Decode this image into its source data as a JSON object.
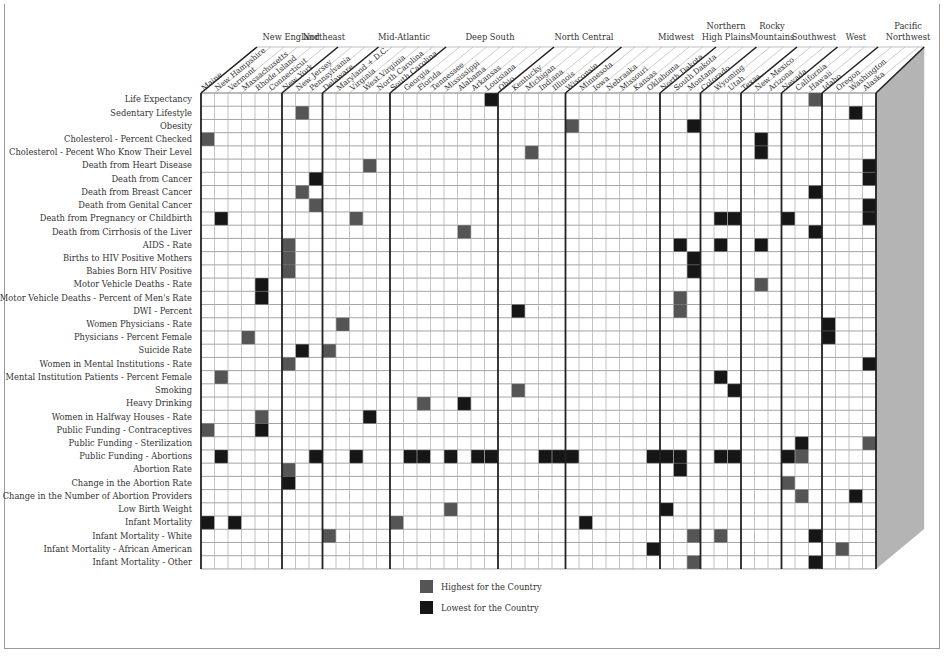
{
  "chart_data": {
    "type": "heatmap",
    "title": "",
    "legend": [
      {
        "key": "H",
        "label": "Highest for the Country",
        "color": "#555555"
      },
      {
        "key": "L",
        "label": "Lowest for the Country",
        "color": "#161616"
      }
    ],
    "regions": [
      {
        "name": "New England",
        "lines": [
          "New England"
        ],
        "states": [
          "Maine",
          "New Hampshire",
          "Vermont",
          "Massachusetts",
          "Rhode Island",
          "Connecticut"
        ]
      },
      {
        "name": "Northeast",
        "lines": [
          "Northeast"
        ],
        "states": [
          "New York",
          "New Jersey",
          "Pennsylvania"
        ]
      },
      {
        "name": "Mid-Atlantic",
        "lines": [
          "Mid-Atlantic"
        ],
        "states": [
          "Delaware",
          "Maryland + D.C.",
          "Virginia",
          "West Virginia",
          "North Carolina"
        ]
      },
      {
        "name": "Deep South",
        "lines": [
          "Deep South"
        ],
        "states": [
          "South Carolina",
          "Georgia",
          "Florida",
          "Tennessee",
          "Mississippi",
          "Alabama",
          "Arkansas",
          "Louisiana"
        ]
      },
      {
        "name": "North Central",
        "lines": [
          "North Central"
        ],
        "states": [
          "Ohio",
          "Kentucky",
          "Michigan",
          "Indiana",
          "Illinois"
        ]
      },
      {
        "name": "Midwest",
        "lines": [
          "Midwest"
        ],
        "states": [
          "Wisconsin",
          "Minnesota",
          "Iowa",
          "Nebraska",
          "Missouri",
          "Kansas",
          "Oklahoma"
        ]
      },
      {
        "name": "Northern High Plains",
        "lines": [
          "Northern",
          "High Plains"
        ],
        "states": [
          "North Dakota",
          "South Dakota",
          "Montana"
        ]
      },
      {
        "name": "Rocky Mountains",
        "lines": [
          "Rocky",
          "Mountains"
        ],
        "states": [
          "Colorado",
          "Wyoming",
          "Utah"
        ]
      },
      {
        "name": "Southwest",
        "lines": [
          "Southwest"
        ],
        "states": [
          "Texas",
          "New Mexico",
          "Arizona"
        ]
      },
      {
        "name": "West",
        "lines": [
          "West"
        ],
        "states": [
          "Nevada",
          "California",
          "Hawaii"
        ]
      },
      {
        "name": "Pacific Northwest",
        "lines": [
          "Pacific",
          "Northwest"
        ],
        "states": [
          "Idaho",
          "Oregon",
          "Washington",
          "Alaska"
        ]
      }
    ],
    "rows": [
      {
        "label": "Life Expectancy",
        "H": [
          45
        ],
        "L": [
          21
        ]
      },
      {
        "label": "Sedentary Lifestyle",
        "H": [
          7
        ],
        "L": [
          48
        ]
      },
      {
        "label": "Obesity",
        "H": [
          27
        ],
        "L": [
          36
        ]
      },
      {
        "label": "Cholesterol - Percent Checked",
        "H": [
          0
        ],
        "L": [
          41
        ]
      },
      {
        "label": "Cholesterol - Pecent Who Know Their Level",
        "H": [
          24
        ],
        "L": [
          41
        ]
      },
      {
        "label": "Death from Heart Disease",
        "H": [
          12
        ],
        "L": [
          49
        ]
      },
      {
        "label": "Death from Cancer",
        "H": [],
        "L": [
          8,
          49
        ]
      },
      {
        "label": "Death from Breast Cancer",
        "H": [
          7
        ],
        "L": [
          45
        ]
      },
      {
        "label": "Death from Genital Cancer",
        "H": [
          8
        ],
        "L": [
          49
        ]
      },
      {
        "label": "Death from Pregnancy or Childbirth",
        "H": [
          11
        ],
        "L": [
          1,
          38,
          39,
          43,
          49
        ]
      },
      {
        "label": "Death from Cirrhosis of the Liver",
        "H": [
          19
        ],
        "L": [
          45
        ]
      },
      {
        "label": "AIDS - Rate",
        "H": [
          6
        ],
        "L": [
          35,
          38,
          41
        ]
      },
      {
        "label": "Births to HIV Positive Mothers",
        "H": [
          6
        ],
        "L": [
          36
        ]
      },
      {
        "label": "Babies Born HIV Positive",
        "H": [
          6
        ],
        "L": [
          36
        ]
      },
      {
        "label": "Motor Vehicle Deaths - Rate",
        "H": [
          41
        ],
        "L": [
          4
        ]
      },
      {
        "label": "Motor Vehicle Deaths - Percent of Men's Rate",
        "H": [
          35
        ],
        "L": [
          4
        ]
      },
      {
        "label": "DWI - Percent",
        "H": [
          35
        ],
        "L": [
          23
        ]
      },
      {
        "label": "Women Physicians - Rate",
        "H": [
          10
        ],
        "L": [
          46
        ]
      },
      {
        "label": "Physicians - Percent Female",
        "H": [
          3
        ],
        "L": [
          46
        ]
      },
      {
        "label": "Suicide Rate",
        "H": [
          9
        ],
        "L": [
          7
        ]
      },
      {
        "label": "Women in Mental Institutions - Rate",
        "H": [
          6
        ],
        "L": [
          49
        ]
      },
      {
        "label": "Mental Institution Patients - Percent Female",
        "H": [
          1
        ],
        "L": [
          38
        ]
      },
      {
        "label": "Smoking",
        "H": [
          23
        ],
        "L": [
          39
        ]
      },
      {
        "label": "Heavy Drinking",
        "H": [
          16
        ],
        "L": [
          19
        ]
      },
      {
        "label": "Women in Halfway Houses - Rate",
        "H": [
          4
        ],
        "L": [
          12
        ]
      },
      {
        "label": "Public Funding - Contraceptives",
        "H": [
          0
        ],
        "L": [
          4
        ]
      },
      {
        "label": "Public Funding - Sterilization",
        "H": [
          49
        ],
        "L": [
          44
        ]
      },
      {
        "label": "Public Funding - Abortions",
        "H": [
          44
        ],
        "L": [
          1,
          8,
          11,
          15,
          16,
          18,
          20,
          21,
          25,
          26,
          27,
          33,
          34,
          35,
          38,
          39,
          43
        ]
      },
      {
        "label": "Abortion Rate",
        "H": [
          6
        ],
        "L": [
          35
        ]
      },
      {
        "label": "Change in the Abortion Rate",
        "H": [
          43
        ],
        "L": [
          6
        ]
      },
      {
        "label": "Change in the Number of Abortion Providers",
        "H": [
          44
        ],
        "L": [
          48
        ]
      },
      {
        "label": "Low Birth Weight",
        "H": [
          18
        ],
        "L": [
          34
        ]
      },
      {
        "label": "Infant Mortality",
        "H": [
          14
        ],
        "L": [
          0,
          2,
          28
        ]
      },
      {
        "label": "Infant Mortality - White",
        "H": [
          9,
          36,
          38
        ],
        "L": [
          45
        ]
      },
      {
        "label": "Infant Mortality - African American",
        "H": [
          47
        ],
        "L": [
          33
        ]
      },
      {
        "label": "Infant Mortality - Other",
        "H": [
          36
        ],
        "L": [
          45
        ]
      }
    ]
  }
}
